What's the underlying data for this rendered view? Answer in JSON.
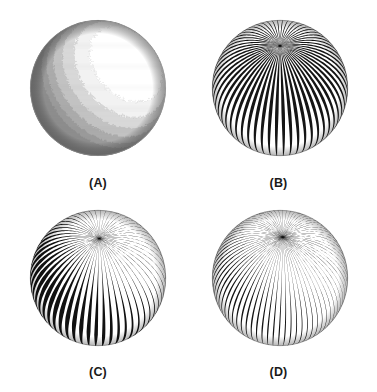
{
  "figure": {
    "background_color": "#ffffff",
    "width": 377,
    "height": 392,
    "label_color": "#1a1a1a",
    "columns": 2,
    "rows": 2
  },
  "panels": [
    {
      "id": "panel-a",
      "label": "(A)",
      "render_mode": "quantized-shading",
      "description": "Sphere with smooth quantized grayscale shading bands",
      "frame": {
        "x": 8,
        "y": 8,
        "width": 180,
        "height": 188
      },
      "sphere": {
        "cx": 90,
        "cy": 80,
        "r": 68
      },
      "light": {
        "x": 0.52,
        "y": 0.46,
        "z": 0.72
      },
      "stripes": {
        "count": 0
      },
      "tone_levels": [
        "#ffffff",
        "#f2f2f2",
        "#d8d8d8",
        "#c2c2c2",
        "#ababab",
        "#9a9a9a",
        "#8d8d8d",
        "#818181"
      ],
      "rim_color": "#9b9b9b",
      "label_y": 168
    },
    {
      "id": "panel-b",
      "label": "(B)",
      "render_mode": "uniform-stripes",
      "description": "Sphere with uniform black and white longitudinal stripes converging at the pole",
      "frame": {
        "x": 188,
        "y": 8,
        "width": 181,
        "height": 188
      },
      "sphere": {
        "cx": 92,
        "cy": 80,
        "r": 68
      },
      "light": {
        "x": 0.52,
        "y": 0.46,
        "z": 0.72
      },
      "stripes": {
        "count": 58,
        "pole_x": 0.0,
        "pole_y": -0.62,
        "min_width": 0.5,
        "max_width": 1.0,
        "modulated": false,
        "color": "#151515"
      },
      "tone_levels": [],
      "rim_color": "#2a2a2a",
      "label_y": 168
    },
    {
      "id": "panel-c",
      "label": "(C)",
      "render_mode": "modulated-stripes",
      "description": "Sphere with stripe widths modulated by surface shading",
      "frame": {
        "x": 8,
        "y": 200,
        "width": 180,
        "height": 188
      },
      "sphere": {
        "cx": 90,
        "cy": 78,
        "r": 68
      },
      "light": {
        "x": 0.52,
        "y": 0.46,
        "z": 0.72
      },
      "stripes": {
        "count": 56,
        "pole_x": 0.02,
        "pole_y": -0.58,
        "min_width": 0.06,
        "max_width": 1.05,
        "modulated": true,
        "color": "#111111"
      },
      "tone_levels": [],
      "rim_color": "#2a2a2a",
      "label_y": 165
    },
    {
      "id": "panel-d",
      "label": "(D)",
      "render_mode": "fine-hatching",
      "description": "Sphere with fine tapered pen hatching lines following surface curvature",
      "frame": {
        "x": 188,
        "y": 200,
        "width": 181,
        "height": 188
      },
      "sphere": {
        "cx": 92,
        "cy": 78,
        "r": 68
      },
      "light": {
        "x": 0.52,
        "y": 0.46,
        "z": 0.72
      },
      "stripes": {
        "count": 74,
        "pole_x": 0.04,
        "pole_y": -0.6,
        "min_width": 0.04,
        "max_width": 0.46,
        "modulated": true,
        "color": "#141414"
      },
      "tone_levels": [],
      "rim_color": "#3a3a3a",
      "label_y": 165
    }
  ]
}
